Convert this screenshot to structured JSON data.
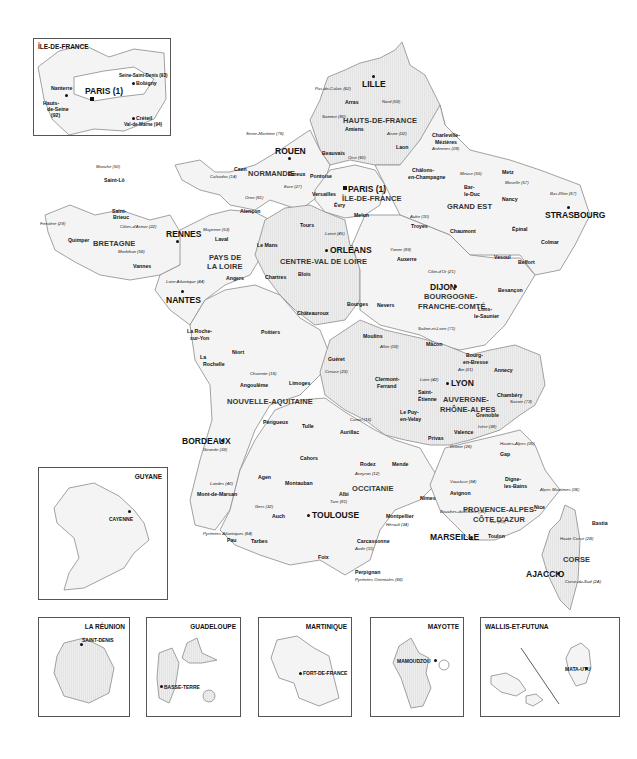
{
  "map": {
    "title": "Régions et départements de France",
    "colors": {
      "land": "#f4f4f4",
      "hatched_land": "#e4e4e4",
      "border": "#8a8a8a",
      "text": "#111111",
      "region_text": "#333333"
    },
    "regions": [
      {
        "name": "HAUTS-DE-FRANCE",
        "capital": "LILLE"
      },
      {
        "name": "NORMANDIE",
        "capital": "ROUEN"
      },
      {
        "name": "ÎLE-DE-FRANCE",
        "capital": "PARIS (1)"
      },
      {
        "name": "GRAND EST",
        "capital": "STRASBOURG"
      },
      {
        "name": "BRETAGNE",
        "capital": "RENNES"
      },
      {
        "name": "PAYS DE LA LOIRE",
        "capital": "NANTES"
      },
      {
        "name": "CENTRE-VAL DE LOIRE",
        "capital": "ORLÉANS"
      },
      {
        "name": "BOURGOGNE-FRANCHE-COMTÉ",
        "capital": "DIJON"
      },
      {
        "name": "NOUVELLE-AQUITAINE",
        "capital": "BORDEAUX"
      },
      {
        "name": "AUVERGNE-RHÔNE-ALPES",
        "capital": "LYON"
      },
      {
        "name": "OCCITANIE",
        "capital": "TOULOUSE"
      },
      {
        "name": "PROVENCE-ALPES-CÔTE D'AZUR",
        "capital": "MARSEILLE"
      },
      {
        "name": "CORSE",
        "capital": "AJACCIO"
      }
    ],
    "labels": {
      "region": {
        "hdf": "HAUTS-DE-FRANCE",
        "normandie": "NORMANDIE",
        "idf": "ÎLE-DE-FRANCE",
        "grand_est": "GRAND EST",
        "bretagne": "BRETAGNE",
        "pdl1": "PAYS DE",
        "pdl2": "LA LOIRE",
        "cvl": "CENTRE-VAL DE LOIRE",
        "bfc1": "BOURGOGNE-",
        "bfc2": "FRANCHE-COMTÉ",
        "na": "NOUVELLE-AQUITAINE",
        "ara1": "AUVERGNE-",
        "ara2": "RHÔNE-ALPES",
        "occ": "OCCITANIE",
        "paca1": "PROVENCE-ALPES-",
        "paca2": "CÔTE D'AZUR",
        "corse": "CORSE"
      },
      "capital": {
        "lille": "LILLE",
        "rouen": "ROUEN",
        "paris": "PARIS (1)",
        "strasbourg": "STRASBOURG",
        "rennes": "RENNES",
        "nantes": "NANTES",
        "orleans": "ORLÉANS",
        "dijon": "DIJON",
        "bordeaux": "BORDEAUX",
        "lyon": "LYON",
        "toulouse": "TOULOUSE",
        "marseille": "MARSEILLE",
        "ajaccio": "AJACCIO"
      },
      "prefecture": {
        "arras": "Arras",
        "amiens": "Amiens",
        "beauvais": "Beauvais",
        "laon": "Laon",
        "charleville": "Charleville-",
        "mezieres": "Mézières",
        "caen": "Caen",
        "saint_lo": "Saint-Lô",
        "evreux": "Évreux",
        "alencon": "Alençon",
        "pontoise": "Pontoise",
        "versailles": "Versailles",
        "evry": "Évry",
        "melun": "Melun",
        "chalons1": "Châlons-",
        "chalons2": "en-Champagne",
        "bar1": "Bar-",
        "bar2": "le-Duc",
        "metz": "Metz",
        "nancy": "Nancy",
        "epinal": "Épinal",
        "troyes": "Troyes",
        "chaumont": "Chaumont",
        "colmar": "Colmar",
        "saint_brieuc1": "Saint-",
        "saint_brieuc2": "Brieuc",
        "quimper": "Quimper",
        "vannes": "Vannes",
        "laval": "Laval",
        "le_mans": "Le Mans",
        "angers": "Angers",
        "tours": "Tours",
        "chartres": "Chartres",
        "blois": "Blois",
        "bourges": "Bourges",
        "chateauroux": "Châteauroux",
        "auxerre": "Auxerre",
        "nevers": "Nevers",
        "vesoul": "Vesoul",
        "belfort": "Belfort",
        "besancon": "Besançon",
        "lons1": "Lons-",
        "lons2": "le-Saunier",
        "macon": "Mâcon",
        "la_roche1": "La Roche-",
        "la_roche2": "sur-Yon",
        "niort": "Niort",
        "poitiers": "Poitiers",
        "la_rochelle1": "La",
        "la_rochelle2": "Rochelle",
        "angouleme": "Angoulême",
        "limoges": "Limoges",
        "gueret": "Guéret",
        "perigueux": "Périgueux",
        "tulle": "Tulle",
        "agen": "Agen",
        "mont_de_marsan": "Mont-de-Marsan",
        "pau": "Pau",
        "moulins": "Moulins",
        "clermont1": "Clermont-",
        "clermont2": "Ferrand",
        "bourg1": "Bourg-",
        "bourg2": "en-Bresse",
        "annecy": "Annecy",
        "chambery": "Chambéry",
        "saint_etienne1": "Saint-",
        "saint_etienne2": "Étienne",
        "grenoble": "Grenoble",
        "aurillac": "Aurillac",
        "le_puy1": "Le Puy-",
        "le_puy2": "en-Velay",
        "privas": "Privas",
        "valence": "Valence",
        "cahors": "Cahors",
        "montauban": "Montauban",
        "rodez": "Rodez",
        "mende": "Mende",
        "albi": "Albi",
        "auch": "Auch",
        "tarbes": "Tarbes",
        "foix": "Foix",
        "carcassonne": "Carcassonne",
        "perpignan": "Perpignan",
        "montpellier": "Montpellier",
        "nimes": "Nîmes",
        "gap": "Gap",
        "digne1": "Digne-",
        "digne2": "les-Bains",
        "avignon": "Avignon",
        "nice": "Nice",
        "toulon": "Toulon",
        "bastia": "Bastia"
      },
      "department": {
        "d62": "Pas-de-Calais (62)",
        "d59": "Nord (59)",
        "d80": "Somme (80)",
        "d02": "Aisne (02)",
        "d60": "Oise (60)",
        "d08": "Ardennes (08)",
        "d76": "Seine-Maritime (76)",
        "d50": "Manche (50)",
        "d14": "Calvados (14)",
        "d27": "Eure (27)",
        "d61": "Orne (61)",
        "d95": "Val-d'Oise (95)",
        "d78": "Yvelines (78)",
        "d91": "Essonne (91)",
        "d77": "Seine-et-Marne (77)",
        "d51": "Marne (51)",
        "d55": "Meuse (55)",
        "d57": "Moselle (57)",
        "d54": "Meurthe-et-Moselle (54)",
        "d67": "Bas-Rhin (67)",
        "d88": "Vosges (88)",
        "d68": "Haut-Rhin (68)",
        "d10": "Aube (10)",
        "d52": "Haute-Marne (52)",
        "d29": "Finistère (29)",
        "d22": "Côtes-d'Armor (22)",
        "d56": "Morbihan (56)",
        "d35": "Ille-et-Vilaine (35)",
        "d53": "Mayenne (53)",
        "d72": "Sarthe (72)",
        "d44": "Loire Atlantique (44)",
        "d49": "Maine-et-Loire (49)",
        "d28": "Eure-et-Loir (28)",
        "d45": "Loiret (45)",
        "d41": "Loir-et-Cher (41)",
        "d37": "Indre-et-Loire (37)",
        "d18": "Cher (18)",
        "d36": "Indre (36)",
        "d89": "Yonne (89)",
        "d21": "Côte-d'Or (21)",
        "d58": "Nièvre (58)",
        "d70": "Haute Saône (70)",
        "d90": "Territoire de Belfort (90)",
        "d25": "Doubs (25)",
        "d39": "Jura (39)",
        "d71": "Saône-et-Loire (71)",
        "d85": "Vendée (85)",
        "d79": "Deux-Sèvres (79)",
        "d86": "Vienne (86)",
        "d17": "Charente-Maritime (17)",
        "d16": "Charente (16)",
        "d87": "Haute Vienne (87)",
        "d23": "Creuse (23)",
        "d19": "Corrèze (19)",
        "d24": "Dordogne (24)",
        "d33": "Gironde (33)",
        "d47": "Lot-et-Garonne (47)",
        "d40": "Landes (40)",
        "d64": "Pyrénées Atlantiques (64)",
        "d03": "Allier (03)",
        "d63": "Puy-de-Dôme (63)",
        "d42": "Loire (42)",
        "d69": "Rhône (69)",
        "d01": "Ain (01)",
        "d74": "Haute Savoie (74)",
        "d73": "Savoie (73)",
        "d38": "Isère (38)",
        "d15": "Cantal (15)",
        "d43": "Haute Loire (43)",
        "d07": "Ardèche (07)",
        "d26": "Drôme (26)",
        "d46": "Lot (46)",
        "d82": "Tarn-et-Garonne (82)",
        "d12": "Aveyron (12)",
        "d48": "Lozère (48)",
        "d81": "Tarn (81)",
        "d32": "Gers (32)",
        "d31": "Haute Garonne (31)",
        "d65": "Hautes Pyrénées (65)",
        "d09": "Ariège (09)",
        "d11": "Aude (11)",
        "d66": "Pyrénées Orientales (66)",
        "d34": "Hérault (34)",
        "d30": "Gard (30)",
        "d84": "Vaucluse (84)",
        "d13": "Bouches-du-Rhône (13)",
        "d04": "Alpes-de-Haute-Provence (04)",
        "d05": "Hautes-Alpes (05)",
        "d06": "Alpes Maritimes (06)",
        "d83": "Var (83)",
        "d2b": "Haute Corse (2B)",
        "d2a": "Corse-du-Sud (2A)"
      }
    },
    "insets": {
      "idf": {
        "title": "ÎLE-DE-FRANCE",
        "paris": "PARIS (1)",
        "nanterre": "Nanterre",
        "bobigny": "Bobigny",
        "creteil": "Créteil",
        "d93": "Seine-Saint-Denis (93)",
        "d92a": "Hauts-",
        "d92b": "de-Seine",
        "d92c": "(92)",
        "d94": "Val-de-Marne (94)"
      },
      "guyane": {
        "title": "GUYANE",
        "city": "CAYENNE"
      },
      "reunion": {
        "title": "LA RÉUNION",
        "city": "SAINT-DENIS"
      },
      "guadeloupe": {
        "title": "GUADELOUPE",
        "city": "BASSE-TERRE"
      },
      "martinique": {
        "title": "MARTINIQUE",
        "city": "FORT-DE-FRANCE"
      },
      "mayotte": {
        "title": "MAYOTTE",
        "city": "MAMOUDZOU"
      },
      "wallis": {
        "title": "WALLIS-ET-FUTUNA",
        "city": "MATA-UTU"
      }
    }
  }
}
